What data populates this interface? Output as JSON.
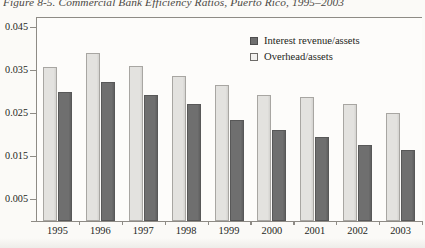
{
  "figure": {
    "caption": "Figure 8-5.  Commercial Bank Efficiency Ratios, Puerto Rico, 1995–2003"
  },
  "legend": {
    "position": "top-right",
    "items": [
      {
        "label": "Interest revenue/assets",
        "color": "#6f6f6f",
        "swatch": "dark"
      },
      {
        "label": "Overhead/assets",
        "color": "#f2f1ef",
        "swatch": "light"
      }
    ]
  },
  "chart_data": {
    "type": "bar",
    "title": "Commercial Bank Efficiency Ratios, Puerto Rico, 1995–2003",
    "xlabel": "",
    "ylabel": "",
    "grid": false,
    "legend_position": "top-right",
    "ylim": [
      0.005,
      0.045
    ],
    "ytick_labels": [
      "0.005",
      "0.015",
      "0.025",
      "0.035",
      "0.045"
    ],
    "ytick_values": [
      0.005,
      0.015,
      0.025,
      0.035,
      0.045
    ],
    "categories": [
      "1995",
      "1996",
      "1997",
      "1998",
      "1999",
      "2000",
      "2001",
      "2002",
      "2003"
    ],
    "series": [
      {
        "name": "Interest revenue/assets",
        "color": "#6f6f6f",
        "values": [
          0.0356,
          0.0389,
          0.0359,
          0.0335,
          0.0316,
          0.0293,
          0.0288,
          0.027,
          0.025
        ]
      },
      {
        "name": "Overhead/assets",
        "color": "#e3e2df",
        "values": [
          0.0298,
          0.0321,
          0.0293,
          0.027,
          0.0234,
          0.021,
          0.0194,
          0.0176,
          0.0165
        ]
      }
    ]
  }
}
